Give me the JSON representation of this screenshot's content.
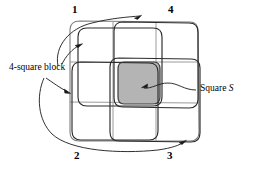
{
  "figure": {
    "type": "diagram",
    "background_color": "#ffffff",
    "ink_color": "#1a1a1a",
    "grid_line_color": "#9a9a9a",
    "shaded_square_fill": "#b4b4b4",
    "shaded_square_stroke": "#3c3c3c"
  },
  "corner_numbers": [
    {
      "id": "1",
      "label": "1",
      "position": "top-left"
    },
    {
      "id": "4",
      "label": "4",
      "position": "top-right"
    },
    {
      "id": "2",
      "label": "2",
      "position": "bottom-left"
    },
    {
      "id": "3",
      "label": "3",
      "position": "bottom-right"
    }
  ],
  "annotations": {
    "block_label": "4-square block",
    "square_label_prefix": "Square ",
    "square_label_symbol": "S"
  },
  "grid": {
    "rows": 3,
    "cols": 3,
    "outer": {
      "x": 70,
      "y": 20,
      "w": 128,
      "h": 122
    }
  },
  "blocks": [
    {
      "name": "block-1-top-left",
      "x": 78,
      "y": 28,
      "w": 84,
      "h": 78
    },
    {
      "name": "block-4-top-right",
      "x": 114,
      "y": 22,
      "w": 84,
      "h": 86
    },
    {
      "name": "block-2-bottom-left",
      "x": 72,
      "y": 62,
      "w": 86,
      "h": 78
    },
    {
      "name": "block-3-bottom-right",
      "x": 110,
      "y": 58,
      "w": 90,
      "h": 84
    }
  ],
  "shaded_square": {
    "x": 118,
    "y": 62,
    "w": 42,
    "h": 42
  }
}
